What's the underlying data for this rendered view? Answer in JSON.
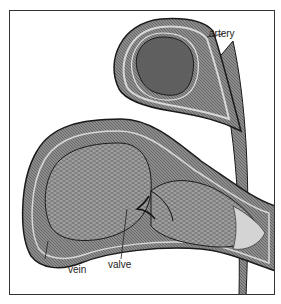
{
  "diagram": {
    "title_fragment": "",
    "labels": {
      "artery": "artery",
      "vein": "vein",
      "valve": "valve"
    },
    "colors": {
      "frame": "#333333",
      "tissue_outer": "#8a8a8a",
      "tissue_inner": "#6e6e6e",
      "lumen": "#9a9a9a",
      "light_band": "#d4d4d4",
      "outline": "#1a1a1a"
    }
  }
}
